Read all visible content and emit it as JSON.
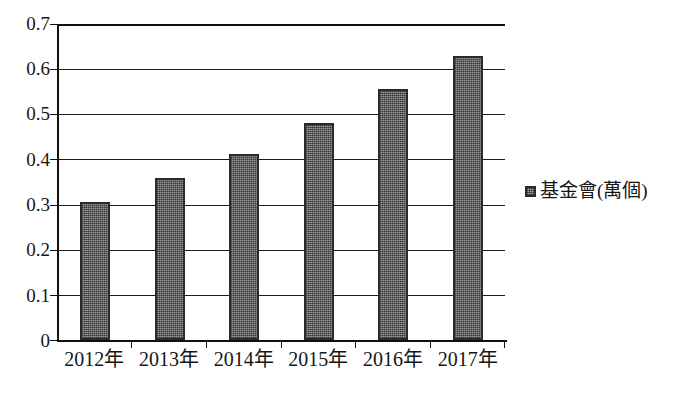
{
  "chart_data": {
    "type": "bar",
    "title": "",
    "subtitle": "",
    "xlabel": "",
    "ylabel": "",
    "categories": [
      "2012年",
      "2013年",
      "2014年",
      "2015年",
      "2016年",
      "2017年"
    ],
    "series": [
      {
        "name": "基金會(萬個)",
        "values": [
          0.305,
          0.358,
          0.413,
          0.48,
          0.555,
          0.63
        ]
      }
    ],
    "values": [
      0.305,
      0.358,
      0.413,
      0.48,
      0.555,
      0.63
    ],
    "ylim": [
      0,
      0.7
    ],
    "ytick_values": [
      0,
      0.1,
      0.2,
      0.3,
      0.4,
      0.5,
      0.6,
      0.7
    ],
    "ytick_labels": [
      "0",
      "0.1",
      "0.2",
      "0.3",
      "0.4",
      "0.5",
      "0.6",
      "0.7"
    ],
    "grid": true,
    "grid_axis": "y",
    "legend_position": "right",
    "legend_entries": [
      "基金會(萬個)"
    ],
    "bar_color": "#6e6e6e",
    "bar_edge_color": "#2a2a2a",
    "background_color": "#ffffff",
    "axis_color": "#111111"
  },
  "axis": {
    "y_labels": [
      "0.7",
      "0.6",
      "0.5",
      "0.4",
      "0.3",
      "0.2",
      "0.1",
      "0"
    ],
    "x_labels": [
      "2012年",
      "2013年",
      "2014年",
      "2015年",
      "2016年",
      "2017年"
    ]
  },
  "legend": {
    "items": [
      {
        "label": "基金會(萬個)",
        "color": "#6e6e6e",
        "marker": "filled-square-icon"
      }
    ]
  }
}
